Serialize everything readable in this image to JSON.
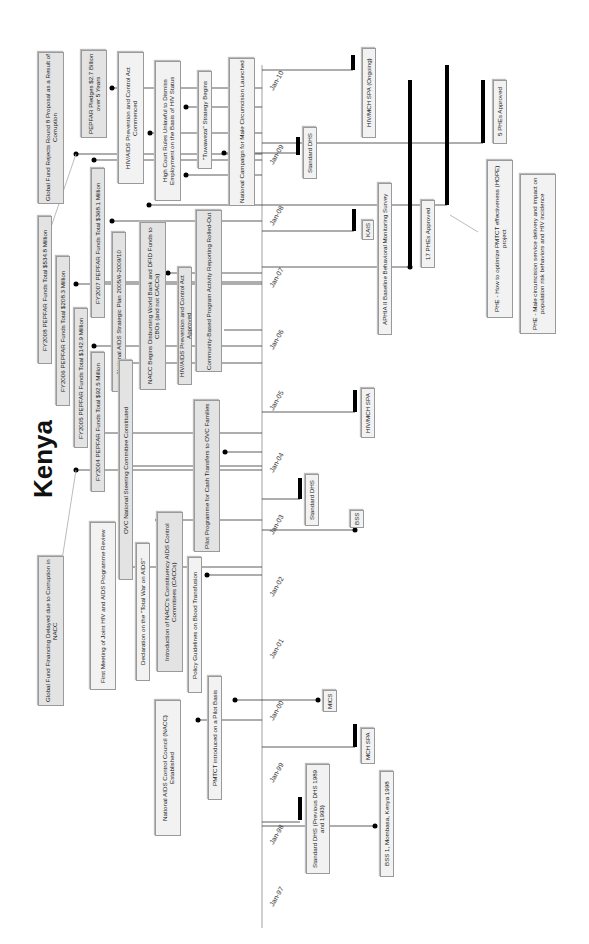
{
  "title": "Kenya",
  "orientation": "rotated-90-ccw",
  "axis": {
    "ticks": [
      {
        "label": "Jan-10",
        "y": 70
      },
      {
        "label": "Jan-09",
        "y": 143
      },
      {
        "label": "Jan-08",
        "y": 205
      },
      {
        "label": "Jan-07",
        "y": 267
      },
      {
        "label": "Jan-06",
        "y": 330
      },
      {
        "label": "Jan-05",
        "y": 391
      },
      {
        "label": "Jan-04",
        "y": 452
      },
      {
        "label": "Jan-03",
        "y": 513
      },
      {
        "label": "Jan-02",
        "y": 575
      },
      {
        "label": "Jan-01",
        "y": 637
      },
      {
        "label": "Jan-00",
        "y": 700
      },
      {
        "label": "Jan-99",
        "y": 760
      },
      {
        "label": "Jan-98",
        "y": 822
      },
      {
        "label": "Jan-97",
        "y": 884
      }
    ]
  },
  "policy_events": [
    {
      "label": "Global Fund Rejects Round 8 Proposal as a Result of Corruption"
    },
    {
      "label": "PEPFAR Pledges $2.7 Billion over 5 Years"
    },
    {
      "label": "HIV/AIDS Prevention and Control Act Commenced"
    },
    {
      "label": "High Court Rules Unlawful to Dismiss Employment on the Basis of HIV Status"
    },
    {
      "label": "\"Tuwaweza\" Strategy Begins"
    },
    {
      "label": "National Campaign for Male Circumcision Launched"
    },
    {
      "label": "FY2008 PEPFAR Funds Total $534.8 Million"
    },
    {
      "label": "FY2007 PEPFAR Funds Total $368.1 Million"
    },
    {
      "label": "FY2006 PEPFAR Funds Total $208.3 Million"
    },
    {
      "label": "FY2005 PEPFAR Funds Total $142.9 Million"
    },
    {
      "label": "FY2004 PEPFAR Funds Total $92.5 Million"
    },
    {
      "label": "National AIDS Strategic Plan 2005/6-2009/10"
    },
    {
      "label": "NACC Begins Disbursing World Bank and DFID Funds to CBOs (and not CACCs)"
    },
    {
      "label": "HIV/AIDS Prevention and Control Act Approved"
    },
    {
      "label": "Community-Based Program Activity Reporting Rolled-Out"
    },
    {
      "label": "OVC National Steering Committee Constituted"
    },
    {
      "label": "Pilot Programme for Cash Transfers to OVC Families"
    },
    {
      "label": "Global Fund Financing Delayed due to Corruption in NACC"
    },
    {
      "label": "First Meeting of Joint HIV and AIDS Programme Review"
    },
    {
      "label": "Declaration on the \"Total War on AIDS\""
    },
    {
      "label": "Introduction of NACC's Constituency AIDS Control Committees (CACCs)"
    },
    {
      "label": "Policy Guidelines on Blood Transfusion"
    },
    {
      "label": "PMTCT introduced on a Pilot Basis"
    },
    {
      "label": "National AIDS Control Council (NACC) Established"
    }
  ],
  "data_events": [
    {
      "label": "HIV/MCH SPA (Ongoing)"
    },
    {
      "label": "Standard DHS"
    },
    {
      "label": "KAIS"
    },
    {
      "label": "APHIA II Baseline Behavioral Monitoring Survey"
    },
    {
      "label": "17 PHEs Approved"
    },
    {
      "label": "5 PHEs Approved"
    },
    {
      "label": "PHE - How to optimize PMTCT effectiveness (HOPE) project"
    },
    {
      "label": "PHE - Male circumcision service delivery and impact on population risk behaviors and HIV incidence"
    },
    {
      "label": "HIV/MCH SPA"
    },
    {
      "label": "Standard DHS"
    },
    {
      "label": "BSS"
    },
    {
      "label": "MICS"
    },
    {
      "label": "MCH SPA"
    },
    {
      "label": "Standard DHS (Previous DHS 1989 and 1993)"
    },
    {
      "label": "BSS 1, Mombasa, Kenya 1998"
    }
  ]
}
